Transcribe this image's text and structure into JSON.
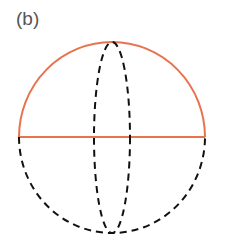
{
  "figure": {
    "label": "(b)",
    "colors": {
      "solid": "#e8734f",
      "dashed": "#111111",
      "label": "#555555"
    },
    "shapes": [
      "upper-hemisphere-arc-solid",
      "equator-line-solid",
      "lower-hemisphere-arc-dashed",
      "meridian-ellipse-dashed"
    ]
  }
}
